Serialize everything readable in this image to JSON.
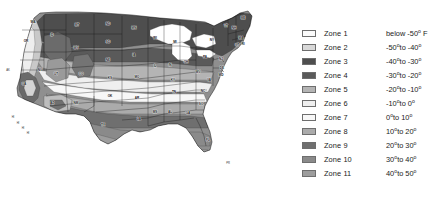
{
  "figure": {
    "background_color": "#ffffff"
  },
  "legend": {
    "name": "hardiness-zone-legend",
    "rows": [
      {
        "zone_label": "Zone 1",
        "range_prefix": "below ",
        "low": "-50",
        "connector": "",
        "high": "",
        "unit_suffix": " F",
        "swatch_color": "#fbfbfb"
      },
      {
        "zone_label": "Zone 2",
        "range_prefix": "",
        "low": "-50",
        "connector": "to ",
        "high": "-40",
        "unit_suffix": "",
        "swatch_color": "#d8d8d8"
      },
      {
        "zone_label": "Zone 3",
        "range_prefix": "",
        "low": "-40",
        "connector": "to ",
        "high": "-30",
        "unit_suffix": "",
        "swatch_color": "#4e4e4e"
      },
      {
        "zone_label": "Zone 4",
        "range_prefix": "",
        "low": "-30",
        "connector": "to ",
        "high": "-20",
        "unit_suffix": "",
        "swatch_color": "#5a5a5a"
      },
      {
        "zone_label": "Zone 5",
        "range_prefix": "",
        "low": "-20",
        "connector": "to ",
        "high": "-10",
        "unit_suffix": "",
        "swatch_color": "#b4b4b4"
      },
      {
        "zone_label": "Zone 6",
        "range_prefix": "",
        "low": "-10",
        "connector": "to ",
        "high": "0",
        "unit_suffix": "",
        "swatch_color": "#efefef"
      },
      {
        "zone_label": "Zone 7",
        "range_prefix": "",
        "low": "0",
        "connector": "to ",
        "high": "10",
        "unit_suffix": "",
        "swatch_color": "#f7f7f7"
      },
      {
        "zone_label": "Zone 8",
        "range_prefix": "",
        "low": "10",
        "connector": "to ",
        "high": "20",
        "unit_suffix": "",
        "swatch_color": "#ababab"
      },
      {
        "zone_label": "Zone 9",
        "range_prefix": "",
        "low": "20",
        "connector": "to ",
        "high": "30",
        "unit_suffix": "",
        "swatch_color": "#6f6f6f"
      },
      {
        "zone_label": "Zone 10",
        "range_prefix": "",
        "low": "30",
        "connector": "to ",
        "high": "40",
        "unit_suffix": "",
        "swatch_color": "#8a8a8a"
      },
      {
        "zone_label": "Zone 11",
        "range_prefix": "",
        "low": "40",
        "connector": "to ",
        "high": "50",
        "unit_suffix": "",
        "swatch_color": "#9d9d9d"
      }
    ]
  },
  "map": {
    "name": "usa-hardiness-map",
    "state_labels": [
      {
        "abbr": "WA",
        "x": 33,
        "y": 22
      },
      {
        "abbr": "OR",
        "x": 26,
        "y": 41
      },
      {
        "abbr": "CA",
        "x": 24,
        "y": 84
      },
      {
        "abbr": "NV",
        "x": 40,
        "y": 70
      },
      {
        "abbr": "ID",
        "x": 52,
        "y": 35
      },
      {
        "abbr": "MT",
        "x": 77,
        "y": 25
      },
      {
        "abbr": "WY",
        "x": 76,
        "y": 48
      },
      {
        "abbr": "UT",
        "x": 56,
        "y": 74
      },
      {
        "abbr": "AZ",
        "x": 52,
        "y": 103
      },
      {
        "abbr": "CO",
        "x": 81,
        "y": 74
      },
      {
        "abbr": "NM",
        "x": 76,
        "y": 103
      },
      {
        "abbr": "ND",
        "x": 108,
        "y": 24
      },
      {
        "abbr": "SD",
        "x": 108,
        "y": 42
      },
      {
        "abbr": "NE",
        "x": 108,
        "y": 60
      },
      {
        "abbr": "KS",
        "x": 110,
        "y": 78
      },
      {
        "abbr": "OK",
        "x": 110,
        "y": 96
      },
      {
        "abbr": "TX",
        "x": 103,
        "y": 125
      },
      {
        "abbr": "MN",
        "x": 134,
        "y": 28
      },
      {
        "abbr": "IA",
        "x": 134,
        "y": 55
      },
      {
        "abbr": "MO",
        "x": 137,
        "y": 77
      },
      {
        "abbr": "AR",
        "x": 137,
        "y": 98
      },
      {
        "abbr": "LA",
        "x": 139,
        "y": 119
      },
      {
        "abbr": "WI",
        "x": 155,
        "y": 38
      },
      {
        "abbr": "IL",
        "x": 155,
        "y": 66
      },
      {
        "abbr": "MS",
        "x": 155,
        "y": 112
      },
      {
        "abbr": "MI",
        "x": 175,
        "y": 42
      },
      {
        "abbr": "IN",
        "x": 170,
        "y": 65
      },
      {
        "abbr": "KY",
        "x": 173,
        "y": 80
      },
      {
        "abbr": "TN",
        "x": 174,
        "y": 92
      },
      {
        "abbr": "AL",
        "x": 170,
        "y": 112
      },
      {
        "abbr": "OH",
        "x": 186,
        "y": 62
      },
      {
        "abbr": "GA",
        "x": 188,
        "y": 113
      },
      {
        "abbr": "WV",
        "x": 198,
        "y": 72
      },
      {
        "abbr": "NC",
        "x": 203,
        "y": 91
      },
      {
        "abbr": "SC",
        "x": 201,
        "y": 104
      },
      {
        "abbr": "PA",
        "x": 205,
        "y": 57
      },
      {
        "abbr": "VA",
        "x": 209,
        "y": 80
      },
      {
        "abbr": "FL",
        "x": 208,
        "y": 140
      },
      {
        "abbr": "NY",
        "x": 212,
        "y": 40
      },
      {
        "abbr": "VT",
        "x": 226,
        "y": 26
      },
      {
        "abbr": "NH",
        "x": 234,
        "y": 28
      },
      {
        "abbr": "ME",
        "x": 243,
        "y": 18
      },
      {
        "abbr": "MA",
        "x": 241,
        "y": 38
      },
      {
        "abbr": "RI",
        "x": 243,
        "y": 44
      },
      {
        "abbr": "CT",
        "x": 237,
        "y": 45
      },
      {
        "abbr": "NJ",
        "x": 221,
        "y": 59
      },
      {
        "abbr": "DE",
        "x": 222,
        "y": 68
      },
      {
        "abbr": "MD",
        "x": 221,
        "y": 75
      }
    ],
    "inset_markers": [
      {
        "label": "HI",
        "x": 13,
        "y": 117
      },
      {
        "label": "HI",
        "x": 18,
        "y": 123
      },
      {
        "label": "HI",
        "x": 23,
        "y": 128
      },
      {
        "label": "HI",
        "x": 28,
        "y": 133
      },
      {
        "label": "PR",
        "x": 228,
        "y": 163
      },
      {
        "label": "AK",
        "x": 8,
        "y": 70
      }
    ]
  }
}
